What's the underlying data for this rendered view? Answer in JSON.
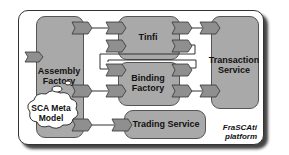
{
  "diagram": {
    "platform_label_line1": "FraSCAti",
    "platform_label_line2": "platform",
    "components": {
      "assembly_factory": {
        "line1": "Assembly",
        "line2": "Factory"
      },
      "tinfi": {
        "line1": "Tinfi"
      },
      "binding_factory": {
        "line1": "Binding",
        "line2": "Factory"
      },
      "transaction_service": {
        "line1": "Transaction",
        "line2": "Service"
      },
      "trading_service": {
        "line1": "Trading Service"
      }
    },
    "cloud": {
      "line1": "SCA Meta",
      "line2": "Model"
    },
    "colors": {
      "component_fill": "#a9a9a9",
      "port_fill": "#8f8f8f",
      "outline": "#333333",
      "background": "#ffffff"
    }
  }
}
